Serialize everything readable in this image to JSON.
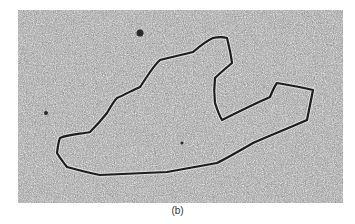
{
  "figure": {
    "panel_label": "(b)",
    "colors": {
      "background_light": "#d8d8d8",
      "background_mid": "#9a9a9a",
      "grain_dark": "#2a2a2a",
      "strand": "#1e1e1e",
      "caption_text": "#333333"
    },
    "strand_path": "M57,153 C58,145 59,140 60,138 C70,134 82,134 90,132 C98,124 103,118 107,113 C111,106 114,101 117,98 C126,94 133,90 140,87 C147,77 153,66 160,60 C171,57 182,55 193,52 C200,46 206,41 213,38 C218,37 223,37 227,38 C229,46 231,55 232,63 C226,68 220,73 215,78 C214,86 214,95 215,103 C217,109 219,115 222,120 C238,112 254,104 270,97 C272,92 274,87 277,83 C289,85 301,87 313,90 C311,100 309,110 307,120 C289,128 271,135 253,143 C241,150 229,157 217,163 C200,166 184,169 167,172 C145,173 122,174 100,175 C89,173 78,170 67,167 C63,162 60,158 57,153 Z",
    "blobs": [
      {
        "cx": 140,
        "cy": 33,
        "r": 3.5
      },
      {
        "cx": 182,
        "cy": 143,
        "r": 1.5
      },
      {
        "cx": 46,
        "cy": 113,
        "r": 2
      }
    ]
  }
}
